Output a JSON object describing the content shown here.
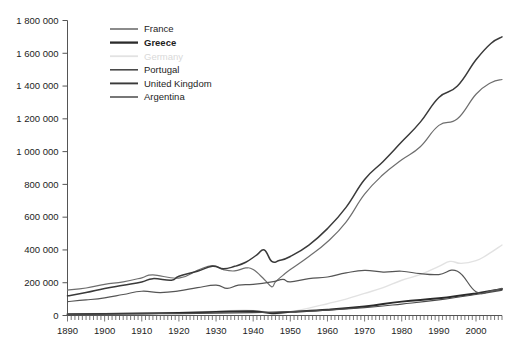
{
  "chart_data": {
    "type": "line",
    "title": "",
    "xlabel": "",
    "ylabel": "",
    "xlim": [
      1890,
      2007
    ],
    "ylim": [
      0,
      1800000
    ],
    "grid": false,
    "legend_position": "top-left",
    "ytick_labels": [
      "0",
      "200 000",
      "400 000",
      "600 000",
      "800 000",
      "1 000 000",
      "1 200 000",
      "1 400 000",
      "1 600 000",
      "1 800 000"
    ],
    "ytick_values": [
      0,
      200000,
      400000,
      600000,
      800000,
      1000000,
      1200000,
      1400000,
      1600000,
      1800000
    ],
    "xtick_labels": [
      "1890",
      "1900",
      "1910",
      "1920",
      "1930",
      "1940",
      "1950",
      "1960",
      "1970",
      "1980",
      "1990",
      "2000"
    ],
    "xtick_values": [
      1890,
      1900,
      1910,
      1920,
      1930,
      1940,
      1950,
      1960,
      1970,
      1980,
      1990,
      2000
    ],
    "minor_xtick_step": 1,
    "series": [
      {
        "name": "France",
        "color": "#6e6e6e",
        "width": 1.2,
        "bold": false,
        "x": [
          1890,
          1895,
          1900,
          1905,
          1910,
          1913,
          1920,
          1925,
          1929,
          1932,
          1935,
          1938,
          1940,
          1943,
          1945,
          1946,
          1948,
          1950,
          1955,
          1960,
          1965,
          1970,
          1975,
          1980,
          1985,
          1990,
          1995,
          2000,
          2004,
          2007
        ],
        "values": [
          155000,
          168000,
          190000,
          205000,
          230000,
          248000,
          228000,
          275000,
          305000,
          280000,
          272000,
          290000,
          280000,
          220000,
          175000,
          205000,
          245000,
          280000,
          360000,
          450000,
          570000,
          740000,
          860000,
          950000,
          1030000,
          1160000,
          1200000,
          1350000,
          1420000,
          1440000
        ]
      },
      {
        "name": "Greece",
        "color": "#2b2b2b",
        "width": 1.9,
        "bold": true,
        "x": [
          1890,
          1900,
          1910,
          1920,
          1930,
          1940,
          1945,
          1950,
          1960,
          1970,
          1980,
          1990,
          2000,
          2007
        ],
        "values": [
          8000,
          10000,
          13000,
          16000,
          22000,
          26000,
          14000,
          22000,
          35000,
          55000,
          85000,
          105000,
          135000,
          162000
        ]
      },
      {
        "name": "Germany",
        "color": "#e2e2e2",
        "width": 1.4,
        "bold": false,
        "x": [
          1890,
          1900,
          1910,
          1920,
          1930,
          1938,
          1944,
          1946,
          1950,
          1955,
          1960,
          1965,
          1970,
          1975,
          1980,
          1985,
          1990,
          1993,
          1996,
          2000,
          2003,
          2007
        ],
        "values": [
          9000,
          12000,
          17000,
          18000,
          26000,
          32000,
          20000,
          8000,
          22000,
          45000,
          72000,
          100000,
          135000,
          170000,
          215000,
          250000,
          300000,
          330000,
          318000,
          335000,
          370000,
          430000
        ]
      },
      {
        "name": "Portugal",
        "color": "#4a4a4a",
        "width": 1.2,
        "bold": false,
        "x": [
          1890,
          1900,
          1910,
          1920,
          1930,
          1940,
          1950,
          1960,
          1970,
          1980,
          1990,
          2000,
          2007
        ],
        "values": [
          6000,
          8000,
          10000,
          12000,
          15000,
          18000,
          24000,
          33000,
          48000,
          70000,
          95000,
          128000,
          155000
        ]
      },
      {
        "name": "United Kingdom",
        "color": "#3a3a3a",
        "width": 1.5,
        "bold": false,
        "x": [
          1890,
          1895,
          1900,
          1905,
          1910,
          1913,
          1918,
          1920,
          1925,
          1929,
          1932,
          1935,
          1938,
          1941,
          1943,
          1945,
          1947,
          1950,
          1955,
          1960,
          1965,
          1970,
          1975,
          1980,
          1985,
          1990,
          1995,
          2000,
          2004,
          2007
        ],
        "values": [
          120000,
          140000,
          165000,
          185000,
          205000,
          225000,
          215000,
          240000,
          270000,
          300000,
          285000,
          300000,
          325000,
          370000,
          400000,
          330000,
          335000,
          360000,
          430000,
          530000,
          660000,
          830000,
          940000,
          1060000,
          1180000,
          1330000,
          1400000,
          1560000,
          1660000,
          1700000
        ]
      },
      {
        "name": "Argentina",
        "color": "#555555",
        "width": 1.2,
        "bold": false,
        "x": [
          1890,
          1895,
          1900,
          1905,
          1910,
          1915,
          1920,
          1925,
          1930,
          1933,
          1936,
          1940,
          1945,
          1948,
          1950,
          1955,
          1960,
          1965,
          1970,
          1975,
          1980,
          1985,
          1990,
          1995,
          2000,
          2004,
          2007
        ],
        "values": [
          85000,
          95000,
          108000,
          128000,
          148000,
          140000,
          150000,
          170000,
          185000,
          165000,
          185000,
          190000,
          205000,
          220000,
          205000,
          225000,
          235000,
          260000,
          275000,
          265000,
          270000,
          255000,
          250000,
          270000,
          145000,
          150000,
          165000
        ]
      }
    ]
  },
  "legend": {
    "items": [
      {
        "label": "France"
      },
      {
        "label": "Greece"
      },
      {
        "label": "Germany"
      },
      {
        "label": "Portugal"
      },
      {
        "label": "United Kingdom"
      },
      {
        "label": "Argentina"
      }
    ]
  },
  "corner_note": {
    "text": ""
  }
}
